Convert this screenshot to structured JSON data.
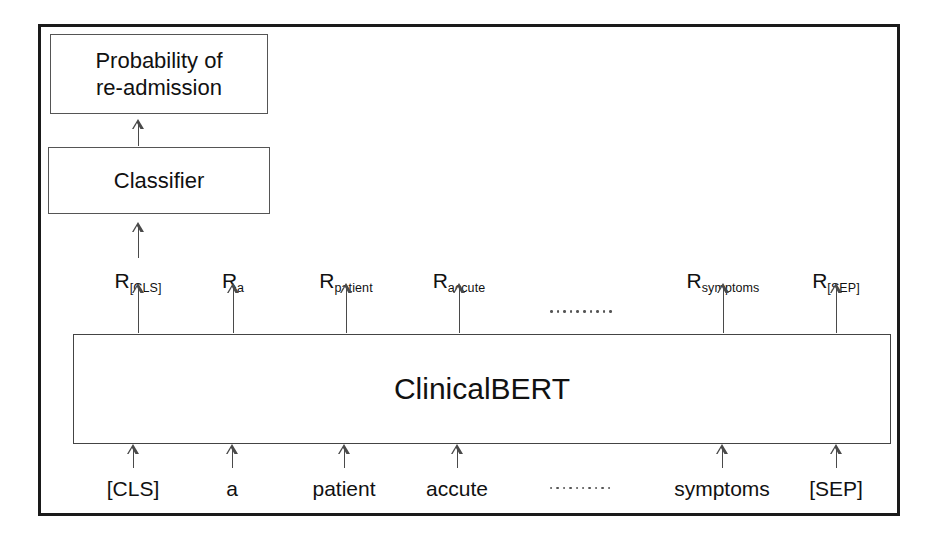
{
  "diagram": {
    "outer_frame": {
      "name": "figure-border"
    },
    "nodes": {
      "output_box": {
        "label": "Probability of\nre-admission"
      },
      "classifier_box": {
        "label": "Classifier"
      },
      "model_box": {
        "label": "ClinicalBERT"
      }
    },
    "representations": [
      {
        "base": "R",
        "sub": "[CLS]",
        "x": 138
      },
      {
        "base": "R",
        "sub": "a",
        "x": 233
      },
      {
        "base": "R",
        "sub": "patient",
        "x": 346
      },
      {
        "base": "R",
        "sub": "accute",
        "x": 459
      },
      {
        "base": "R",
        "sub": "symptoms",
        "x": 723
      },
      {
        "base": "R",
        "sub": "[SEP]",
        "x": 836
      }
    ],
    "tokens": [
      {
        "label": "[CLS]",
        "x": 133
      },
      {
        "label": "a",
        "x": 232
      },
      {
        "label": "patient",
        "x": 344
      },
      {
        "label": "accute",
        "x": 457
      },
      {
        "label": "symptoms",
        "x": 722
      },
      {
        "label": "[SEP]",
        "x": 836
      }
    ],
    "ellipsis": {
      "representations_row": {
        "x": 581,
        "y": 310,
        "count": 10
      },
      "tokens_row": {
        "x": 580,
        "y": 487,
        "count": 10
      }
    },
    "arrows": {
      "classifier_to_output": {
        "x": 138,
        "top": 119,
        "height": 27
      },
      "representations_to_classifier": {
        "x": 138,
        "top": 222,
        "height": 36
      },
      "bert_to_representations_y": 283,
      "bert_to_representations_height": 50,
      "tokens_to_bert_y": 444,
      "tokens_to_bert_height": 24
    },
    "colors": {
      "frame": "#1a1a1a",
      "box_border": "#555555",
      "arrow": "#4a4a4a",
      "text": "#111111",
      "background": "#ffffff"
    }
  }
}
